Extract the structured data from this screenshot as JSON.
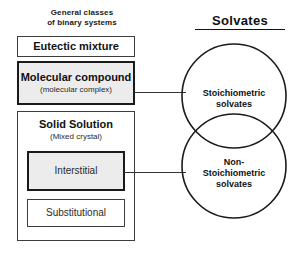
{
  "diagram": {
    "left_caption": "General classes\nof binary systems",
    "right_title": "Solvates",
    "boxes": {
      "eutectic": {
        "title": "Eutectic mixture"
      },
      "molecular": {
        "title": "Molecular compound",
        "subtitle": "(molecular complex)"
      },
      "solid_solution": {
        "title": "Solid Solution",
        "subtitle": "(Mixed crystal)"
      },
      "interstitial": {
        "title": "Interstitial"
      },
      "substitutional": {
        "title": "Substitutional"
      }
    },
    "circles": {
      "stoichiometric": {
        "label": "Stoichiometric\nsolvates"
      },
      "non_stoichiometric": {
        "label": "Non-\nStoichiometric\nsolvates"
      }
    },
    "connectors": [
      {
        "from": "molecular",
        "to": "stoichiometric"
      },
      {
        "from": "interstitial",
        "to": "non_stoichiometric"
      }
    ],
    "colors": {
      "background": "#ffffff",
      "stroke": "#1a1a1a",
      "thin_stroke": "#3d3d3d",
      "shaded_fill": "#ececed",
      "text": "#111111"
    }
  }
}
